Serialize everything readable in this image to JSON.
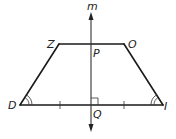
{
  "diagram": {
    "type": "isosceles-trapezoid-with-symmetry-line",
    "colors": {
      "stroke": "#1a1a1a",
      "background": "#ffffff"
    },
    "vertices": {
      "Z": {
        "label": "Z",
        "x": 59,
        "y": 44
      },
      "O": {
        "label": "O",
        "x": 124,
        "y": 44
      },
      "I": {
        "label": "I",
        "x": 163,
        "y": 105
      },
      "D": {
        "label": "D",
        "x": 20,
        "y": 105
      }
    },
    "line": {
      "label": "m",
      "x": 91,
      "y_top": 12,
      "y_bottom": 132
    },
    "points": {
      "P": {
        "label": "P"
      },
      "Q": {
        "label": "Q"
      }
    },
    "markings": {
      "congruent_angles": [
        "D",
        "I"
      ],
      "angle_arc_count": 2,
      "congruent_segments": [
        "DQ",
        "QI"
      ],
      "right_angle_at": "Q"
    }
  }
}
